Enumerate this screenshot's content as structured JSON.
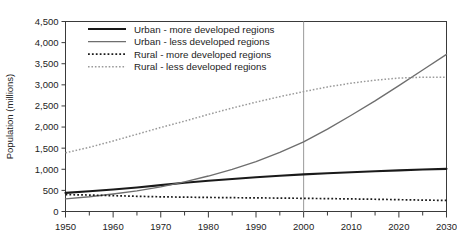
{
  "chart_data": {
    "type": "line",
    "title": "",
    "xlabel": "",
    "ylabel": "Population (millions)",
    "xlim": [
      1950,
      2030
    ],
    "ylim": [
      0,
      4500
    ],
    "ytick_step": 500,
    "xtick_step": 10,
    "x_minor_step": 5,
    "grid": false,
    "legend_position": "top-left-inside",
    "yticks": [
      "0",
      "500",
      "1,000",
      "1,500",
      "2,000",
      "2,500",
      "3,000",
      "3,500",
      "4,000",
      "4,500"
    ],
    "ytick_values": [
      0,
      500,
      1000,
      1500,
      2000,
      2500,
      3000,
      3500,
      4000,
      4500
    ],
    "xticks": [
      "1950",
      "1960",
      "1970",
      "1980",
      "1990",
      "2000",
      "2010",
      "2020",
      "2030"
    ],
    "xtick_values": [
      1950,
      1960,
      1970,
      1980,
      1990,
      2000,
      2010,
      2020,
      2030
    ],
    "x": [
      1950,
      1955,
      1960,
      1965,
      1970,
      1975,
      1980,
      1985,
      1990,
      1995,
      2000,
      2005,
      2010,
      2015,
      2020,
      2025,
      2030
    ],
    "series": [
      {
        "name": "Urban - more developed regions",
        "key": "urban-more-developed",
        "style": "solid",
        "color": "#1a1a1a",
        "width": 2.1,
        "values": [
          440,
          480,
          520,
          570,
          625,
          680,
          730,
          770,
          810,
          845,
          880,
          905,
          930,
          955,
          975,
          995,
          1010
        ]
      },
      {
        "name": "Urban - less developed regions",
        "key": "urban-less-developed",
        "style": "solid",
        "color": "#6e6e6e",
        "width": 1.35,
        "values": [
          300,
          350,
          415,
          490,
          585,
          700,
          840,
          1000,
          1180,
          1400,
          1650,
          1950,
          2280,
          2620,
          2980,
          3350,
          3720
        ]
      },
      {
        "name": "Rural - more developed regions",
        "key": "rural-more-developed",
        "style": "dotted",
        "color": "#1a1a1a",
        "width": 1.7,
        "values": [
          400,
          390,
          375,
          360,
          348,
          340,
          333,
          327,
          322,
          318,
          312,
          305,
          298,
          290,
          280,
          270,
          262
        ]
      },
      {
        "name": "Rural - less developed regions",
        "key": "rural-less-developed",
        "style": "dotted",
        "color": "#9a9a9a",
        "width": 1.5,
        "values": [
          1390,
          1520,
          1670,
          1830,
          1990,
          2140,
          2300,
          2450,
          2590,
          2720,
          2840,
          2950,
          3040,
          3110,
          3160,
          3180,
          3180
        ]
      }
    ],
    "reference_lines": [
      {
        "name": "year-2000-marker",
        "orientation": "vertical",
        "value": 2000,
        "color": "#9a9a9a"
      }
    ]
  },
  "legend": {
    "entries": [
      {
        "label": "Urban - more developed regions"
      },
      {
        "label": "Urban - less developed regions"
      },
      {
        "label": "Rural - more developed regions"
      },
      {
        "label": "Rural - less developed regions"
      }
    ]
  }
}
